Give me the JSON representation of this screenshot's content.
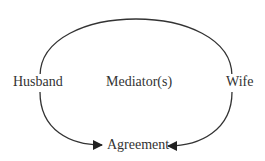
{
  "diagram": {
    "nodes": {
      "husband": {
        "label": "Husband"
      },
      "mediators": {
        "label": "Mediator(s)"
      },
      "wife": {
        "label": "Wife"
      },
      "agreement": {
        "label": "Agreement"
      }
    },
    "edges": [
      {
        "from": "husband",
        "to": "wife",
        "style": "arc",
        "arrow": false
      },
      {
        "from": "husband",
        "to": "agreement",
        "style": "curve",
        "arrow": true
      },
      {
        "from": "wife",
        "to": "agreement",
        "style": "curve",
        "arrow": true
      }
    ],
    "colors": {
      "stroke": "#333333",
      "text": "#333333",
      "background": "#ffffff"
    }
  }
}
